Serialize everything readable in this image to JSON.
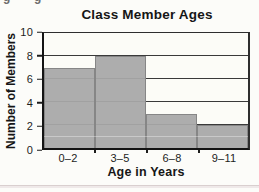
{
  "page": {
    "background_color": "#fcfcf9",
    "bottom_rule_color": "#d9cfcf",
    "cropped_text_fragments": [
      "g",
      "g"
    ]
  },
  "chart_data": {
    "type": "bar",
    "title": "Class Member Ages",
    "xlabel": "Age in Years",
    "ylabel": "Number of Members",
    "categories": [
      "0–2",
      "3–5",
      "6–8",
      "9–11"
    ],
    "values": [
      7,
      8,
      3,
      2
    ],
    "ylim": [
      0,
      10
    ],
    "yticks": [
      0,
      2,
      4,
      6,
      8,
      10
    ],
    "grid": "horizontal gridlines at labeled ticks",
    "legend": "none",
    "bar_color": "#a8a8a8",
    "bar_edge_color": "#868686",
    "style": "histogram — bars touch with no gaps"
  }
}
